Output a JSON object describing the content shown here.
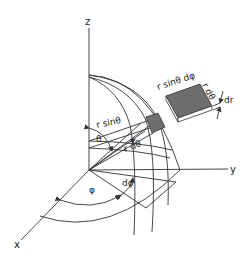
{
  "figure": {
    "axes": {
      "z": "z",
      "y": "y",
      "x": "x"
    },
    "angles": {
      "theta": "θ",
      "phi": "φ",
      "dphi": "dφ"
    },
    "element_labels": {
      "r_sin_theta": "r sinθ",
      "r_dtheta": "r dθ"
    },
    "detached_element": {
      "top_edge": "r sinθ dφ",
      "side_edge": "r dθ",
      "thickness": "dr"
    },
    "colors": {
      "element_fill": "#6e6e6e",
      "line": "#333333"
    }
  }
}
